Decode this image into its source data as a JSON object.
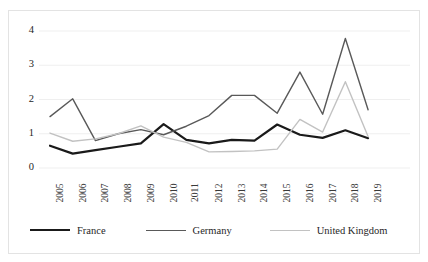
{
  "chart_data": {
    "type": "line",
    "title": "",
    "xlabel": "",
    "ylabel": "",
    "categories": [
      "2005",
      "2006",
      "2007",
      "2008",
      "2009",
      "2010",
      "2011",
      "2012",
      "2013",
      "2014",
      "2015",
      "2016",
      "2017",
      "2018",
      "2019"
    ],
    "ylim": [
      0,
      4
    ],
    "yticks": [
      0,
      1,
      2,
      3,
      4
    ],
    "grid": true,
    "legend_position": "bottom",
    "series": [
      {
        "name": "France",
        "color": "#1a1a1a",
        "width": 2.2,
        "values": [
          0.65,
          0.42,
          0.52,
          0.62,
          0.72,
          1.28,
          0.82,
          0.72,
          0.82,
          0.8,
          1.27,
          0.97,
          0.88,
          1.1,
          0.87
        ]
      },
      {
        "name": "Germany",
        "color": "#595959",
        "width": 1.4,
        "values": [
          1.5,
          2.02,
          0.8,
          1.0,
          1.12,
          0.97,
          1.22,
          1.53,
          2.12,
          2.12,
          1.6,
          2.8,
          1.57,
          3.78,
          1.7
        ]
      },
      {
        "name": "United Kingdom",
        "color": "#c2c2c2",
        "width": 1.4,
        "values": [
          1.02,
          0.78,
          0.85,
          1.0,
          1.23,
          0.9,
          0.75,
          0.47,
          0.48,
          0.5,
          0.55,
          1.42,
          1.05,
          2.52,
          0.92
        ]
      }
    ]
  },
  "legend": {
    "items": [
      {
        "label": "France"
      },
      {
        "label": "Germany"
      },
      {
        "label": "United Kingdom"
      }
    ]
  },
  "axes": {
    "y_tick_labels": [
      "4",
      "3",
      "2",
      "1",
      "0"
    ],
    "x_tick_labels": [
      "2005",
      "2006",
      "2007",
      "2008",
      "2009",
      "2010",
      "2011",
      "2012",
      "2013",
      "2014",
      "2015",
      "2016",
      "2017",
      "2018",
      "2019"
    ]
  },
  "colors": {
    "france": "#1a1a1a",
    "germany": "#595959",
    "united_kingdom": "#c2c2c2",
    "grid": "#efefef",
    "frame": "#e3e3e3",
    "text": "#262626"
  }
}
